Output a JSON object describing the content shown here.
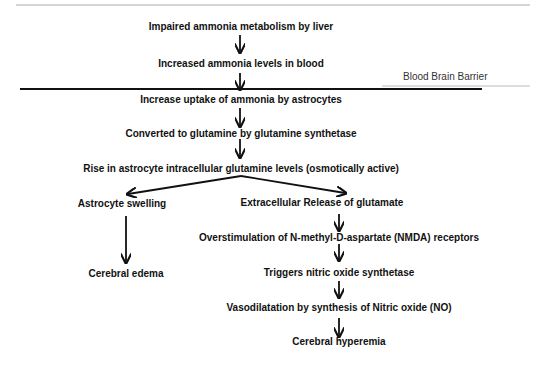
{
  "diagram": {
    "barrier_label": "Blood Brain Barrier",
    "nodes": [
      {
        "id": "n1",
        "text": "Impaired ammonia metabolism by liver"
      },
      {
        "id": "n2",
        "text": "Increased ammonia levels in blood"
      },
      {
        "id": "n3",
        "text": "Increase uptake of ammonia by astrocytes"
      },
      {
        "id": "n4",
        "text": "Converted to glutamine by glutamine synthetase"
      },
      {
        "id": "n5",
        "text": "Rise in astrocyte intracellular glutamine levels (osmotically active)"
      },
      {
        "id": "n6",
        "text": "Astrocyte swelling"
      },
      {
        "id": "n7",
        "text": "Extracellular Release of glutamate"
      },
      {
        "id": "n8",
        "text": "Cerebral edema"
      },
      {
        "id": "n9",
        "text": "Overstimulation of N-methyl-D-aspartate (NMDA) receptors"
      },
      {
        "id": "n10",
        "text": "Triggers nitric oxide synthetase"
      },
      {
        "id": "n11",
        "text": "Vasodilatation by synthesis of Nitric oxide (NO)"
      },
      {
        "id": "n12",
        "text": "Cerebral hyperemia"
      }
    ],
    "edges": [
      [
        "n1",
        "n2"
      ],
      [
        "n2",
        "n3"
      ],
      [
        "n3",
        "n4"
      ],
      [
        "n4",
        "n5"
      ],
      [
        "n5",
        "n6"
      ],
      [
        "n5",
        "n7"
      ],
      [
        "n6",
        "n8"
      ],
      [
        "n7",
        "n9"
      ],
      [
        "n9",
        "n10"
      ],
      [
        "n10",
        "n11"
      ],
      [
        "n11",
        "n12"
      ]
    ]
  }
}
